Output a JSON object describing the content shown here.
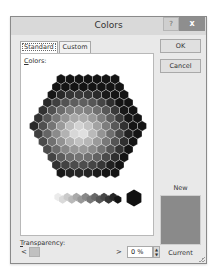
{
  "window": {
    "title": "Colors",
    "help_glyph": "?",
    "close_glyph": "x"
  },
  "tabs": [
    {
      "label": "Standard",
      "active": true
    },
    {
      "label": "Custom",
      "active": false
    }
  ],
  "panel": {
    "colors_label_mnemonic": "C",
    "colors_label_rest": "olors:"
  },
  "buttons": {
    "ok": "OK",
    "cancel": "Cancel"
  },
  "preview": {
    "new_label": "New",
    "current_label": "Current",
    "new_color": "#8a8a8a"
  },
  "transparency": {
    "label_mnemonic": "T",
    "label_rest": "ransparency:",
    "left_arrow": "<",
    "right_arrow": ">",
    "value": "0 %",
    "spin_up": "▲",
    "spin_down": "▼"
  },
  "palette": {
    "type": "hexagon-grayscale",
    "grayscale_row_count": 14,
    "selected_cell": "black"
  }
}
